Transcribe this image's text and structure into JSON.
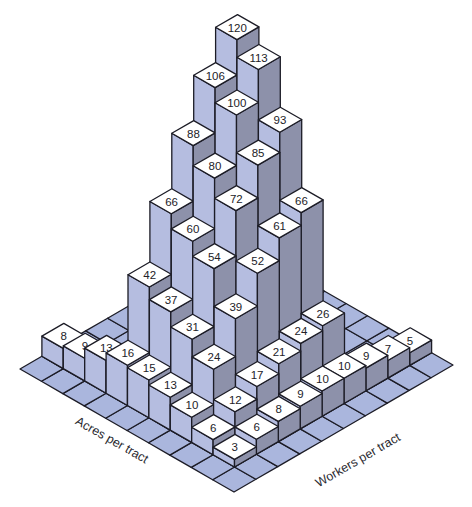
{
  "chart_data": {
    "type": "bar3d",
    "title": "",
    "x_axis_label": "Acres per tract",
    "y_axis_label": "Workers per tract",
    "grid_size": [
      9,
      9
    ],
    "note": "values[i][j]: i = acres-per-tract index (front corner going back-left), j = workers-per-tract index (front corner going back-right); null = no bar",
    "values": [
      [
        3,
        6,
        8,
        9,
        10,
        10,
        9,
        7,
        5
      ],
      [
        6,
        12,
        17,
        21,
        24,
        26,
        null,
        null,
        null
      ],
      [
        10,
        24,
        39,
        52,
        61,
        66,
        null,
        null,
        null
      ],
      [
        13,
        31,
        54,
        72,
        85,
        93,
        null,
        null,
        null
      ],
      [
        15,
        37,
        60,
        80,
        100,
        113,
        null,
        null,
        null
      ],
      [
        16,
        42,
        66,
        88,
        106,
        120,
        null,
        null,
        null
      ],
      [
        13,
        null,
        null,
        null,
        null,
        null,
        null,
        null,
        null
      ],
      [
        9,
        null,
        null,
        null,
        null,
        null,
        null,
        null,
        null
      ],
      [
        8,
        null,
        null,
        null,
        null,
        null,
        null,
        null,
        null
      ]
    ],
    "ylim": [
      0,
      120
    ],
    "grid": true,
    "legend": null
  },
  "colors": {
    "top_face": "#ffffff",
    "left_face": "#b5bde0",
    "right_face": "#8d91aa",
    "floor": "#aab6dd",
    "outline": "#1c1c26",
    "label_text": "#222228"
  },
  "labels": {
    "acres_axis": "Acres per tract",
    "workers_axis": "Workers per tract"
  }
}
